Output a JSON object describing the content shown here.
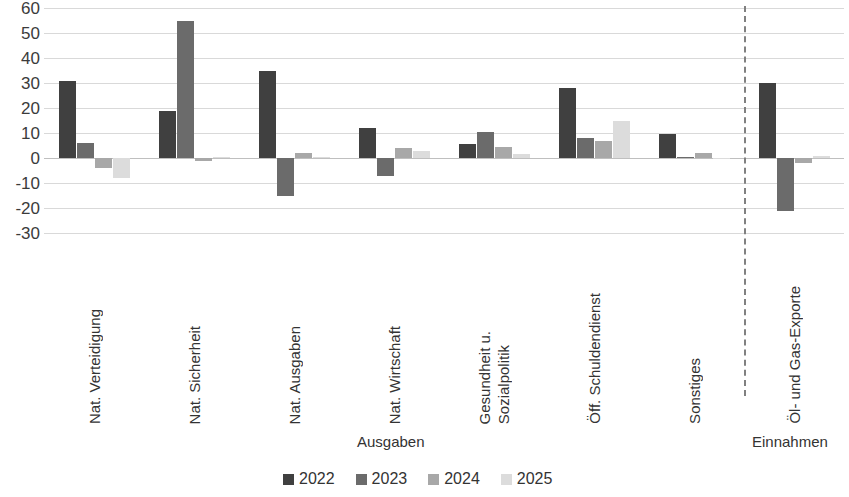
{
  "chart_data": {
    "type": "bar",
    "title": "",
    "xlabel": "",
    "ylabel": "",
    "ylim": [
      -30,
      60
    ],
    "ytick_step": 10,
    "ytick_labels": [
      "60",
      "50",
      "40",
      "30",
      "20",
      "10",
      "0",
      "-10",
      "-20",
      "-30"
    ],
    "grid": true,
    "legend_position": "bottom",
    "categories": [
      "Nat. Verteidigung",
      "Nat. Sicherheit",
      "Nat. Ausgaben",
      "Nat. Wirtschaft",
      "Gesundheit u.|Sozialpolitik",
      "Öff. Schuldendienst",
      "Sonstiges",
      "Öl- und Gas-Exporte"
    ],
    "category_lines": [
      [
        "Nat. Verteidigung"
      ],
      [
        "Nat. Sicherheit"
      ],
      [
        "Nat. Ausgaben"
      ],
      [
        "Nat. Wirtschaft"
      ],
      [
        "Gesundheit u.",
        "Sozialpolitik"
      ],
      [
        "Öff. Schuldendienst"
      ],
      [
        "Sonstiges"
      ],
      [
        "Öl- und Gas-Exporte"
      ]
    ],
    "series": [
      {
        "name": "2022",
        "color": "#404040",
        "values": [
          31,
          19,
          35,
          12,
          5.5,
          28,
          9.5,
          30
        ]
      },
      {
        "name": "2023",
        "color": "#6b6b6b",
        "values": [
          6,
          55,
          -15,
          -7,
          10.5,
          8,
          0.5,
          -21
        ]
      },
      {
        "name": "2024",
        "color": "#a8a8a8",
        "values": [
          -4,
          -1,
          2,
          4,
          4.5,
          7,
          2,
          -2
        ]
      },
      {
        "name": "2025",
        "color": "#dcdcdc",
        "values": [
          -8,
          0.3,
          0.5,
          3,
          1.5,
          15,
          -0.5,
          1
        ]
      }
    ],
    "section_labels": [
      {
        "id": "ausgaben",
        "text": "Ausgaben"
      },
      {
        "id": "einnahmen",
        "text": "Einnahmen"
      }
    ],
    "divider": {
      "after_category_index": 6,
      "style": "dashed"
    },
    "legend": [
      {
        "label": "2022",
        "color": "#404040"
      },
      {
        "label": "2023",
        "color": "#6b6b6b"
      },
      {
        "label": "2024",
        "color": "#a8a8a8"
      },
      {
        "label": "2025",
        "color": "#dcdcdc"
      }
    ]
  }
}
